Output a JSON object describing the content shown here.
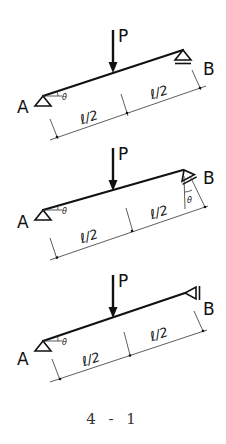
{
  "figure": {
    "caption": "4 - 1",
    "diagrams": [
      {
        "id": "a",
        "support_A": "pin (triangle)",
        "support_B": "roller (horizontal surface)",
        "labels": {
          "A": "A",
          "B": "B",
          "load": "P",
          "angle": "θ",
          "span_left": "ℓ/2",
          "span_right": "ℓ/2"
        }
      },
      {
        "id": "b",
        "support_A": "pin (triangle)",
        "support_B": "roller on surface inclined at θ",
        "labels": {
          "A": "A",
          "B": "B",
          "load": "P",
          "angle": "θ",
          "angle_B": "θ",
          "span_left": "ℓ/2",
          "span_right": "ℓ/2"
        }
      },
      {
        "id": "c",
        "support_A": "pin (triangle)",
        "support_B": "roller against vertical wall",
        "labels": {
          "A": "A",
          "B": "B",
          "load": "P",
          "angle": "θ",
          "span_left": "ℓ/2",
          "span_right": "ℓ/2"
        }
      }
    ]
  }
}
